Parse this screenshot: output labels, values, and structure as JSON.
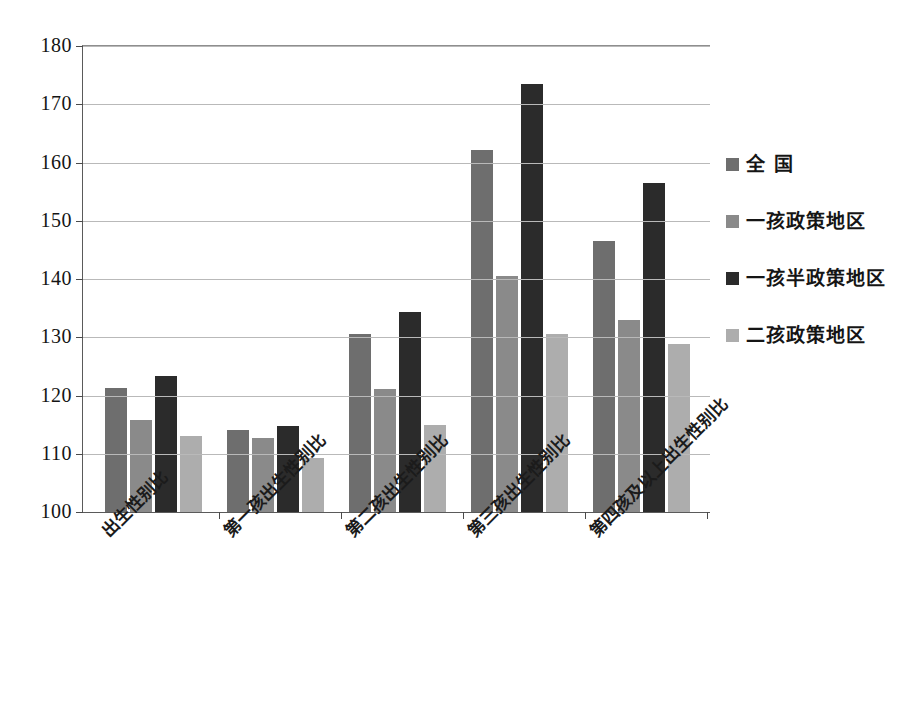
{
  "chart_data": {
    "type": "bar",
    "title": "",
    "subtitle": "",
    "xlabel": "",
    "ylabel": "",
    "ylim": [
      100,
      180
    ],
    "ytick_step": 10,
    "yticks": [
      180,
      170,
      160,
      150,
      140,
      130,
      120,
      110,
      100
    ],
    "grid": true,
    "legend_position": "right",
    "categories": [
      "出生性别比",
      "第一孩出生性别比",
      "第二孩出生性别比",
      "第三孩出生性别比",
      "第四孩及以上出生性别比"
    ],
    "series": [
      {
        "name": "全  国",
        "color": "#6e6e6e",
        "values": [
          121.3,
          114.0,
          130.6,
          162.1,
          146.5
        ]
      },
      {
        "name": "一孩政策地区",
        "color": "#8a8a8a",
        "values": [
          115.8,
          112.7,
          121.2,
          140.6,
          133.0
        ]
      },
      {
        "name": "一孩半政策地区",
        "color": "#2b2b2b",
        "values": [
          123.4,
          114.8,
          134.4,
          173.4,
          156.4
        ]
      },
      {
        "name": "二孩政策地区",
        "color": "#adadad",
        "values": [
          113.0,
          109.2,
          114.9,
          130.6,
          128.8
        ]
      }
    ]
  },
  "axis": {
    "tick_color": "#4a4a4a",
    "grid_color": "#b9b9b9",
    "frame_color": "#5a5a5a"
  }
}
